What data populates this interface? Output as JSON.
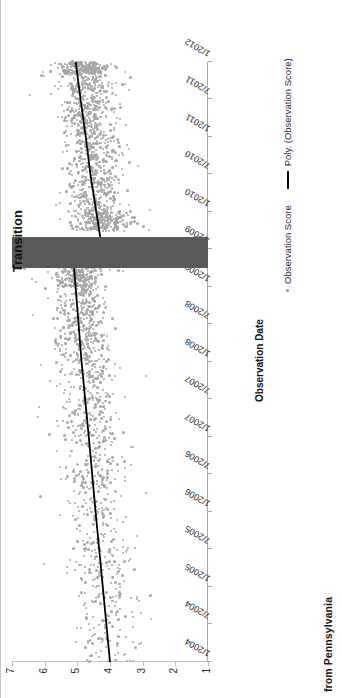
{
  "figure": {
    "caption": "from Pennsylvania",
    "transition_label": "Transition"
  },
  "chart_data": {
    "type": "scatter",
    "title": "",
    "xlabel": "Observation Date",
    "ylabel": "Observation Score",
    "ylim": [
      1,
      7
    ],
    "grid": false,
    "legend_position": "bottom-right",
    "legend": [
      {
        "marker": "dot",
        "label": "Observation Score"
      },
      {
        "marker": "line",
        "label": "Poly. (Observation Score)"
      }
    ],
    "yticks": [
      1,
      2,
      3,
      4,
      5,
      6,
      7
    ],
    "ytick_labels": [
      "1",
      "2",
      "3",
      "4",
      "5",
      "6",
      "7"
    ],
    "xticks": [
      "1/2004",
      "7/2004",
      "1/2005",
      "7/2005",
      "1/2006",
      "7/2006",
      "1/2007",
      "7/2007",
      "1/2008",
      "7/2008",
      "1/2009",
      "7/2009",
      "1/2010",
      "7/2010",
      "1/2011",
      "7/2011",
      "1/2012"
    ],
    "x_range": [
      "1/2004",
      "1/2012"
    ],
    "annotations": [
      {
        "name": "transition-band",
        "label": "Transition",
        "x_start": "4/2009",
        "x_end": "9/2009",
        "y_start": 1.0,
        "y_end": 7.0,
        "color": "#595959"
      }
    ],
    "series": [
      {
        "name": "Observation Score",
        "type": "scatter",
        "color": "#a6a6a6",
        "marker": "dot",
        "n_points": 2600,
        "description": "Dense gray cloud of individual observation scores spanning 1/2004 to 1/2012; scores concentrated between 3 and 6, denser and higher after the transition band.",
        "density_by_period": [
          {
            "period": "2004",
            "n": 120,
            "y_mean": 4.1,
            "y_spread": 1.1
          },
          {
            "period": "2005",
            "n": 150,
            "y_mean": 4.3,
            "y_spread": 1.1
          },
          {
            "period": "2006",
            "n": 180,
            "y_mean": 4.5,
            "y_spread": 1.0
          },
          {
            "period": "2007",
            "n": 230,
            "y_mean": 4.7,
            "y_spread": 1.0
          },
          {
            "period": "2008",
            "n": 330,
            "y_mean": 4.9,
            "y_spread": 0.9
          },
          {
            "period": "2009H1",
            "n": 260,
            "y_mean": 5.0,
            "y_spread": 0.85
          },
          {
            "period": "2009H2",
            "n": 260,
            "y_mean": 4.3,
            "y_spread": 0.95
          },
          {
            "period": "2010",
            "n": 420,
            "y_mean": 4.5,
            "y_spread": 0.9
          },
          {
            "period": "2011",
            "n": 480,
            "y_mean": 4.7,
            "y_spread": 0.85
          },
          {
            "period": "2012",
            "n": 170,
            "y_mean": 4.9,
            "y_spread": 0.8
          }
        ]
      },
      {
        "name": "Poly. (Observation Score)",
        "type": "line",
        "color": "#000000",
        "segments": [
          {
            "name": "pre-transition",
            "x_start": "1/2004",
            "x_end": "4/2009",
            "y_start": 4.0,
            "y_end": 5.1,
            "points": [
              {
                "x": "1/2004",
                "y": 4.0
              },
              {
                "x": "1/2005",
                "y": 4.22
              },
              {
                "x": "1/2006",
                "y": 4.44
              },
              {
                "x": "1/2007",
                "y": 4.65
              },
              {
                "x": "1/2008",
                "y": 4.87
              },
              {
                "x": "4/2009",
                "y": 5.1
              }
            ]
          },
          {
            "name": "post-transition",
            "x_start": "9/2009",
            "x_end": "1/2012",
            "y_start": 4.3,
            "y_end": 5.05,
            "points": [
              {
                "x": "9/2009",
                "y": 4.3
              },
              {
                "x": "1/2010",
                "y": 4.42
              },
              {
                "x": "7/2010",
                "y": 4.6
              },
              {
                "x": "1/2011",
                "y": 4.74
              },
              {
                "x": "7/2011",
                "y": 4.9
              },
              {
                "x": "1/2012",
                "y": 5.05
              }
            ]
          }
        ]
      }
    ]
  }
}
